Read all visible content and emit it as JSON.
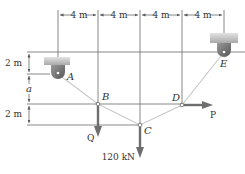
{
  "figure": {
    "type": "cable-system-statics-diagram",
    "colors": {
      "guide_line": "#6b6b6b",
      "cable": "#c8c8c8",
      "force_arrow": "#6e6e6e",
      "support_block": "#b9b9b9",
      "support_block_top": "#d9d9d9",
      "pin_body": "#7a7a7a",
      "text": "#333333"
    },
    "top_dimensions": [
      {
        "label": "4 m"
      },
      {
        "label": "4 m"
      },
      {
        "label": "4 m"
      },
      {
        "label": "4 m"
      }
    ],
    "left_dimensions": [
      {
        "label": "2 m"
      },
      {
        "label": "a"
      },
      {
        "label": "2 m"
      }
    ],
    "points": {
      "A": {
        "label": "A"
      },
      "B": {
        "label": "B"
      },
      "C": {
        "label": "C"
      },
      "D": {
        "label": "D"
      },
      "E": {
        "label": "E"
      }
    },
    "forces": {
      "Q": {
        "label": "Q",
        "direction": "down",
        "at": "B"
      },
      "load_C": {
        "label": "120 kN",
        "direction": "down",
        "at": "C"
      },
      "P": {
        "label": "P",
        "direction": "right",
        "at": "D"
      }
    },
    "supports": [
      {
        "name": "support-A",
        "at": "A"
      },
      {
        "name": "support-E",
        "at": "E"
      }
    ]
  }
}
